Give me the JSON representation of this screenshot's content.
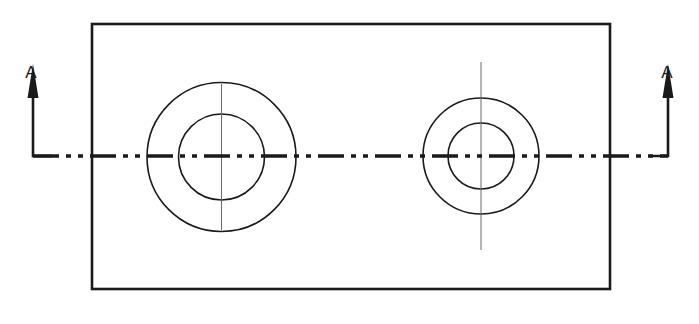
{
  "drawing": {
    "title": "Sectioned part plan view with section line A-A",
    "type": "engineering-drawing",
    "canvas": {
      "width": 699,
      "height": 324,
      "background": "#ffffff"
    },
    "colors": {
      "outline": "#1a1a1a",
      "circle": "#1a1a1a",
      "centerline": "#1a1a1a",
      "thin_centerline": "#6b6b6b",
      "arrow": "#1a1a1a",
      "text": "#1a1a1a",
      "background": "#ffffff"
    },
    "plate": {
      "name": "outer-rectangle",
      "x": 92,
      "y": 24,
      "width": 518,
      "height": 265,
      "stroke_width": 2.6
    },
    "bosses": [
      {
        "name": "left-boss",
        "cx": 221.5,
        "cy": 157,
        "outer_radius": 74.5,
        "inner_radius": 43,
        "stroke_width": 1.6,
        "vertical_centerline": {
          "top": 84,
          "bottom": 230,
          "stroke_width": 1.0
        }
      },
      {
        "name": "right-boss",
        "cx": 481,
        "cy": 156,
        "outer_radius": 58,
        "inner_radius": 33,
        "stroke_width": 1.6,
        "vertical_centerline": {
          "top": 62,
          "bottom": 250,
          "stroke_width": 1.0
        }
      }
    ],
    "section_line": {
      "name": "section-centerline-a-a",
      "y": 156,
      "x_start": 33,
      "x_end": 668,
      "stroke_width": 3.4,
      "pattern": "dash-dot",
      "dash_array": "26 7 5 7 5 7"
    },
    "section_arrows": [
      {
        "name": "section-arrow-left",
        "label": "A",
        "label_x": 31,
        "label_y": 78,
        "line_x": 33,
        "line_top": 88,
        "line_bottom": 156,
        "elbow_to_x": 52,
        "direction": "up",
        "stroke_width": 2.6
      },
      {
        "name": "section-arrow-right",
        "label": "A",
        "label_x": 667,
        "label_y": 78,
        "line_x": 668,
        "line_top": 88,
        "line_bottom": 156,
        "elbow_to_x": 649,
        "direction": "up",
        "stroke_width": 2.6
      }
    ],
    "arrowhead": {
      "name": "solid-filled-arrowhead",
      "style": "filled-triangle",
      "half_width": 5.5,
      "length": 34
    }
  }
}
